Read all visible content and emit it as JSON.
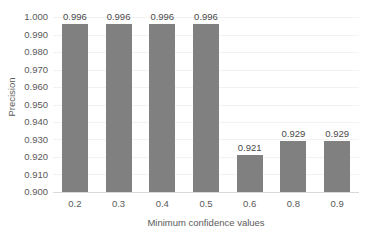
{
  "chart_data": {
    "type": "bar",
    "title": "",
    "subtitle": "",
    "xlabel": "Minimum confidence values",
    "ylabel": "Precision",
    "categories": [
      "0.2",
      "0.3",
      "0.4",
      "0.5",
      "0.6",
      "0.8",
      "0.9"
    ],
    "values": [
      0.996,
      0.996,
      0.996,
      0.996,
      0.921,
      0.929,
      0.929
    ],
    "value_labels": [
      "0.996",
      "0.996",
      "0.996",
      "0.996",
      "0.921",
      "0.929",
      "0.929"
    ],
    "ylim": [
      0.9,
      1.0
    ],
    "ytick_step": 0.01,
    "ytick_labels": [
      "1.000",
      "0.990",
      "0.980",
      "0.970",
      "0.960",
      "0.950",
      "0.940",
      "0.930",
      "0.920",
      "0.910",
      "0.900"
    ],
    "ytick_values": [
      1.0,
      0.99,
      0.98,
      0.97,
      0.96,
      0.95,
      0.94,
      0.93,
      0.92,
      0.91,
      0.9
    ],
    "grid": "horizontal",
    "legend": "none",
    "data_labels_shown": true,
    "colors": {
      "bar": "#808080",
      "gridline": "#f2f2f2",
      "axis_line": "#d9d9d9",
      "text": "#5a5a5a",
      "background": "#ffffff"
    }
  }
}
